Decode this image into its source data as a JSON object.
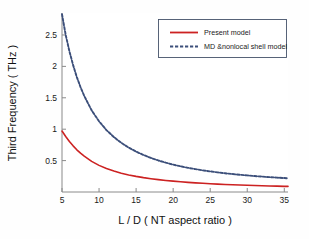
{
  "chart_data": {
    "type": "line",
    "title": "",
    "xlabel": "L / D ( NT aspect ratio )",
    "ylabel": "Third Frequency ( THz )",
    "xlim": [
      5,
      35.5
    ],
    "ylim": [
      0,
      2.85
    ],
    "xticks": [
      5,
      10,
      15,
      20,
      25,
      30,
      35
    ],
    "xticklabels": [
      "5",
      "10",
      "15",
      "20",
      "25",
      "30",
      "35"
    ],
    "yticks": [
      0.5,
      1,
      1.5,
      2,
      2.5
    ],
    "yticklabels": [
      "0.5",
      "1",
      "1.5",
      "2",
      "2.5"
    ],
    "grid": false,
    "legend_position": "top-right",
    "x": [
      5,
      5.5,
      6,
      6.5,
      7,
      7.5,
      8,
      9,
      10,
      11,
      12,
      13,
      14,
      15,
      16,
      17,
      18,
      19,
      20,
      21,
      22,
      23,
      24,
      25,
      26,
      27,
      28,
      29,
      30,
      31,
      32,
      33,
      34,
      35,
      35.5
    ],
    "series": [
      {
        "name": "Present model",
        "color": "#cc2222",
        "style": "solid",
        "values": [
          0.97,
          0.885,
          0.805,
          0.735,
          0.672,
          0.618,
          0.57,
          0.487,
          0.424,
          0.373,
          0.333,
          0.3,
          0.272,
          0.249,
          0.229,
          0.212,
          0.197,
          0.184,
          0.173,
          0.163,
          0.154,
          0.146,
          0.139,
          0.132,
          0.126,
          0.12,
          0.115,
          0.111,
          0.107,
          0.103,
          0.099,
          0.096,
          0.093,
          0.09,
          0.089
        ]
      },
      {
        "name": "MD &nonlocal shell model",
        "color": "#3c4f7a",
        "style": "dashed",
        "values": [
          2.83,
          2.5,
          2.24,
          2.02,
          1.83,
          1.67,
          1.53,
          1.3,
          1.125,
          0.985,
          0.875,
          0.783,
          0.707,
          0.643,
          0.589,
          0.542,
          0.502,
          0.467,
          0.436,
          0.409,
          0.385,
          0.364,
          0.345,
          0.328,
          0.312,
          0.298,
          0.286,
          0.274,
          0.264,
          0.254,
          0.245,
          0.237,
          0.229,
          0.222,
          0.219
        ]
      }
    ]
  }
}
